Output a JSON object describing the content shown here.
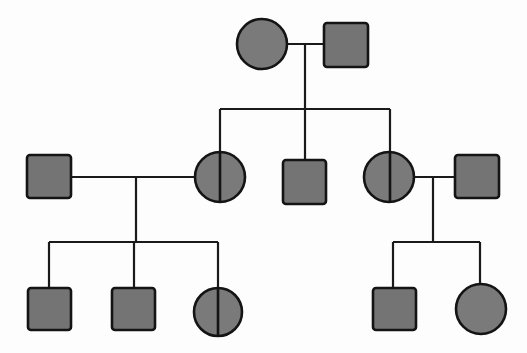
{
  "title": "Pedigree chart",
  "colors": {
    "affected_fill": "#7a7a7a",
    "outline": "#141414",
    "line": "#1a1a1a",
    "background": "#fdfdfd"
  },
  "legend_meaning": {
    "square": "male",
    "circle": "female",
    "filled": "affected",
    "split_circle": "female with vertical divider (half-shaded marking)"
  },
  "generations": [
    {
      "label": "Generation I",
      "individuals": [
        {
          "id": "I-1",
          "sex": "female",
          "shape": "circle",
          "status": "affected",
          "cx": 262,
          "cy": 44
        },
        {
          "id": "I-2",
          "sex": "male",
          "shape": "square",
          "status": "affected",
          "cx": 346,
          "cy": 45
        }
      ]
    },
    {
      "label": "Generation II",
      "individuals": [
        {
          "id": "II-1",
          "sex": "male",
          "shape": "square",
          "status": "affected",
          "cx": 49,
          "cy": 176,
          "note": "married-in"
        },
        {
          "id": "II-2",
          "sex": "female",
          "shape": "split-circle",
          "status": "divided",
          "cx": 220,
          "cy": 177
        },
        {
          "id": "II-3",
          "sex": "male",
          "shape": "square",
          "status": "affected",
          "cx": 304,
          "cy": 182
        },
        {
          "id": "II-4",
          "sex": "female",
          "shape": "split-circle",
          "status": "divided",
          "cx": 389,
          "cy": 177
        },
        {
          "id": "II-5",
          "sex": "male",
          "shape": "square",
          "status": "affected",
          "cx": 477,
          "cy": 176,
          "note": "married-in"
        }
      ]
    },
    {
      "label": "Generation III",
      "individuals": [
        {
          "id": "III-1",
          "sex": "male",
          "shape": "square",
          "status": "affected",
          "cx": 49,
          "cy": 309
        },
        {
          "id": "III-2",
          "sex": "male",
          "shape": "square",
          "status": "affected",
          "cx": 132,
          "cy": 309
        },
        {
          "id": "III-3",
          "sex": "female",
          "shape": "split-circle",
          "status": "divided",
          "cx": 218,
          "cy": 312
        },
        {
          "id": "III-4",
          "sex": "male",
          "shape": "square",
          "status": "affected",
          "cx": 394,
          "cy": 309
        },
        {
          "id": "III-5",
          "sex": "female",
          "shape": "circle",
          "status": "affected",
          "cx": 481,
          "cy": 309
        }
      ]
    }
  ],
  "relationships": [
    {
      "type": "marriage",
      "between": [
        "I-1",
        "I-2"
      ],
      "children": [
        "II-2",
        "II-3",
        "II-4"
      ]
    },
    {
      "type": "marriage",
      "between": [
        "II-1",
        "II-2"
      ],
      "children": [
        "III-1",
        "III-2",
        "III-3"
      ]
    },
    {
      "type": "marriage",
      "between": [
        "II-4",
        "II-5"
      ],
      "children": [
        "III-4",
        "III-5"
      ]
    }
  ]
}
